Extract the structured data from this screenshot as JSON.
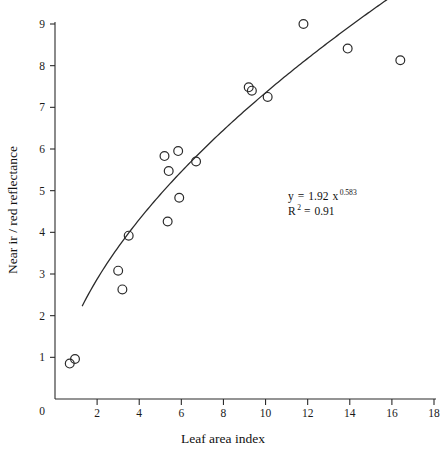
{
  "chart_data": {
    "type": "scatter",
    "title": "",
    "xlabel": "Leaf area index",
    "ylabel": "Near ir / red reflectance",
    "xlim": [
      0,
      18
    ],
    "ylim": [
      0,
      9
    ],
    "xticks": [
      0,
      2,
      4,
      6,
      8,
      10,
      12,
      14,
      16,
      18
    ],
    "xticklabels": [
      "0",
      "2",
      "4",
      "6",
      "8",
      "10",
      "12",
      "14",
      "16",
      "18"
    ],
    "yticks": [
      0,
      1,
      2,
      3,
      4,
      5,
      6,
      7,
      8,
      9
    ],
    "yticklabels": [
      "0",
      "1",
      "2",
      "3",
      "4",
      "5",
      "6",
      "7",
      "8",
      "9"
    ],
    "grid": false,
    "legend": null,
    "marker": "open-circle",
    "marker_color": "#2b2b2b",
    "points": [
      {
        "x": 0.7,
        "y": 0.85
      },
      {
        "x": 0.95,
        "y": 0.96
      },
      {
        "x": 3.0,
        "y": 3.08
      },
      {
        "x": 3.2,
        "y": 2.63
      },
      {
        "x": 3.5,
        "y": 3.92
      },
      {
        "x": 5.2,
        "y": 5.83
      },
      {
        "x": 5.4,
        "y": 5.47
      },
      {
        "x": 5.35,
        "y": 4.26
      },
      {
        "x": 5.85,
        "y": 5.95
      },
      {
        "x": 5.9,
        "y": 4.83
      },
      {
        "x": 6.7,
        "y": 5.7
      },
      {
        "x": 9.2,
        "y": 7.48
      },
      {
        "x": 9.35,
        "y": 7.4
      },
      {
        "x": 10.1,
        "y": 7.25
      },
      {
        "x": 11.8,
        "y": 9.0
      },
      {
        "x": 13.9,
        "y": 8.41
      },
      {
        "x": 16.4,
        "y": 8.13
      }
    ],
    "fit": {
      "model": "power",
      "coefficient": 1.92,
      "exponent": 0.583,
      "r_squared": 0.91,
      "x_start": 1.3,
      "x_end": 16.8,
      "curve_color": "#2b2b2b"
    },
    "annotations": {
      "equation_lhs": "y",
      "equation_eq": "=",
      "equation_coefficient": "1.92",
      "equation_variable": "x",
      "equation_exponent": "0.583",
      "r_symbol": "R",
      "r_exponent": "2",
      "r_eq": "=",
      "r_value": "0.91"
    }
  }
}
